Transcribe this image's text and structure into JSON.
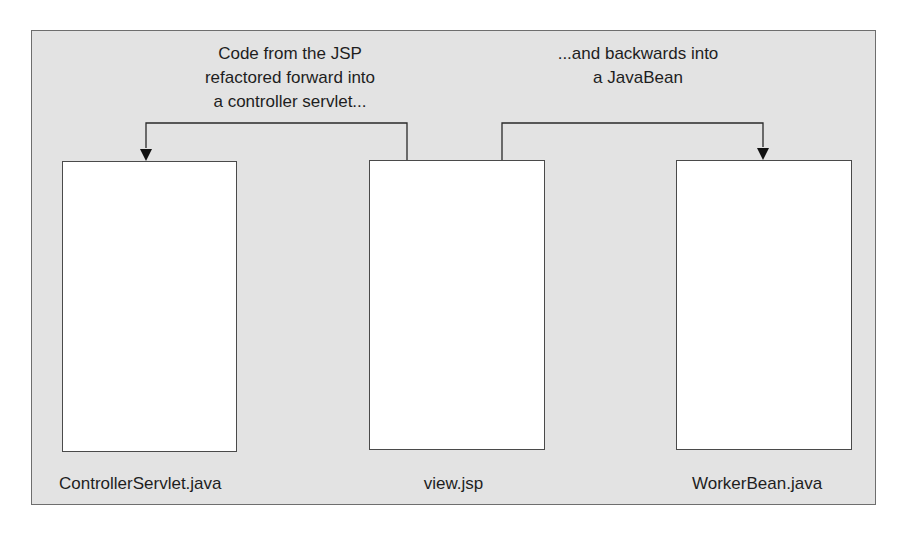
{
  "diagram": {
    "type": "refactoring-flow",
    "colors": {
      "frame_background": "#e3e3e3",
      "frame_border": "#6e6e6e",
      "box_fill": "#ffffff",
      "line": "#2a2a2a",
      "text": "#1e1e1e"
    },
    "captions": {
      "forward": "Code from the JSP\nrefactored forward into\na controller servlet...",
      "backward": "...and backwards into\na JavaBean"
    },
    "nodes": [
      {
        "id": "servlet",
        "label": "ControllerServlet.java"
      },
      {
        "id": "view",
        "label": "view.jsp"
      },
      {
        "id": "bean",
        "label": "WorkerBean.java"
      }
    ],
    "edges": [
      {
        "from": "view",
        "to": "servlet",
        "direction": "forward",
        "caption": "forward"
      },
      {
        "from": "view",
        "to": "bean",
        "direction": "backward",
        "caption": "backward"
      }
    ]
  }
}
